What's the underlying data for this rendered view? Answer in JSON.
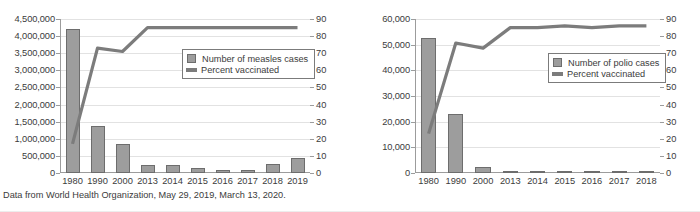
{
  "footnote": "Data from World Health Organization, May 29, 2019, March 13, 2020.",
  "charts": [
    {
      "id": "measles",
      "legend": {
        "bars_label": "Number of measles cases",
        "line_label": "Percent vaccinated"
      },
      "chart_data": {
        "type": "bar",
        "title": "",
        "xlabel": "",
        "ylabel": "",
        "categories": [
          "1980",
          "1990",
          "2000",
          "2013",
          "2014",
          "2015",
          "2016",
          "2017",
          "2018",
          "2019"
        ],
        "series": [
          {
            "name": "Number of measles cases",
            "type": "bar",
            "axis": "left",
            "values": [
              4200000,
              1360000,
              840000,
              230000,
              230000,
              160000,
              75000,
              100000,
              260000,
              450000
            ]
          },
          {
            "name": "Percent vaccinated",
            "type": "line",
            "axis": "right",
            "values": [
              17,
              73,
              71,
              85,
              85,
              85,
              85,
              85,
              85,
              85
            ]
          }
        ],
        "ylim": [
          0,
          4500000
        ],
        "yticks": [
          0,
          500000,
          1000000,
          1500000,
          2000000,
          2500000,
          3000000,
          3500000,
          4000000,
          4500000
        ],
        "ytick_labels": [
          "0",
          "500,000",
          "1,000,000",
          "1,500,000",
          "2,000,000",
          "2,500,000",
          "3,000,000",
          "3,500,000",
          "4,000,000",
          "4,500,000"
        ],
        "y2lim": [
          0,
          90
        ],
        "y2ticks": [
          0,
          10,
          20,
          30,
          40,
          50,
          60,
          70,
          80,
          90
        ],
        "y2tick_labels": [
          "0",
          "10",
          "20",
          "30",
          "40",
          "50",
          "60",
          "70",
          "80",
          "90"
        ],
        "grid": true,
        "legend_position": "center-right",
        "bar_color": "#9d9d9d",
        "line_color": "#7c7c7c"
      }
    },
    {
      "id": "polio",
      "legend": {
        "bars_label": "Number of polio cases",
        "line_label": "Percent vaccinated"
      },
      "chart_data": {
        "type": "bar",
        "title": "",
        "xlabel": "",
        "ylabel": "",
        "categories": [
          "1980",
          "1990",
          "2000",
          "2013",
          "2014",
          "2015",
          "2016",
          "2017",
          "2018"
        ],
        "series": [
          {
            "name": "Number of polio cases",
            "type": "bar",
            "axis": "left",
            "values": [
              52500,
              23000,
              2300,
              400,
              360,
              150,
              120,
              300,
              250
            ]
          },
          {
            "name": "Percent vaccinated",
            "type": "line",
            "axis": "right",
            "values": [
              23,
              76,
              73,
              85,
              85,
              86,
              85,
              86,
              86
            ]
          }
        ],
        "ylim": [
          0,
          60000
        ],
        "yticks": [
          0,
          10000,
          20000,
          30000,
          40000,
          50000,
          60000
        ],
        "ytick_labels": [
          "0",
          "10,000",
          "20,000",
          "30,000",
          "40,000",
          "50,000",
          "60,000"
        ],
        "y2lim": [
          0,
          90
        ],
        "y2ticks": [
          0,
          10,
          20,
          30,
          40,
          50,
          60,
          70,
          80,
          90
        ],
        "y2tick_labels": [
          "0",
          "10",
          "20",
          "30",
          "40",
          "50",
          "60",
          "70",
          "80",
          "90"
        ],
        "grid": true,
        "legend_position": "center-right",
        "bar_color": "#9d9d9d",
        "line_color": "#7c7c7c"
      }
    }
  ]
}
